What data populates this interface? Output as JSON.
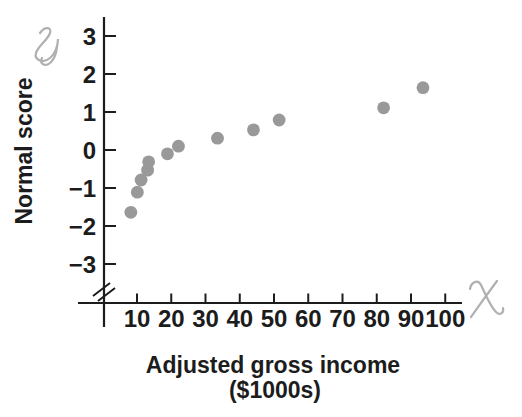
{
  "figure": {
    "ylabel": "Normal score",
    "xlabel_line1": "Adjusted gross income",
    "xlabel_line2": "($1000s)",
    "y_axis_symbol": "y",
    "x_axis_symbol": "x",
    "text_color": "#1c1c1c"
  },
  "chart_data": {
    "type": "scatter",
    "title": "",
    "xlabel": "Adjusted gross income ($1000s)",
    "ylabel": "Normal score",
    "x_ticks": [
      10,
      20,
      30,
      40,
      50,
      60,
      70,
      80,
      90,
      100
    ],
    "y_ticks": [
      3,
      2,
      1,
      0,
      -1,
      -2,
      -3
    ],
    "xlim": [
      0,
      105
    ],
    "ylim": [
      -3.8,
      3.8
    ],
    "x_axis_break_at_origin": true,
    "grid": false,
    "legend": false,
    "points": [
      {
        "x": 8.2,
        "y": -1.64
      },
      {
        "x": 10.1,
        "y": -1.11
      },
      {
        "x": 11.2,
        "y": -0.79
      },
      {
        "x": 13.1,
        "y": -0.53
      },
      {
        "x": 13.4,
        "y": -0.31
      },
      {
        "x": 18.9,
        "y": -0.1
      },
      {
        "x": 22.1,
        "y": 0.1
      },
      {
        "x": 33.5,
        "y": 0.31
      },
      {
        "x": 44.0,
        "y": 0.53
      },
      {
        "x": 51.5,
        "y": 0.79
      },
      {
        "x": 82.0,
        "y": 1.11
      },
      {
        "x": 93.5,
        "y": 1.64
      }
    ],
    "axis_color": "#1c1c1c",
    "point_color": "#999999",
    "script_letter_color": "#b0b0b0"
  }
}
